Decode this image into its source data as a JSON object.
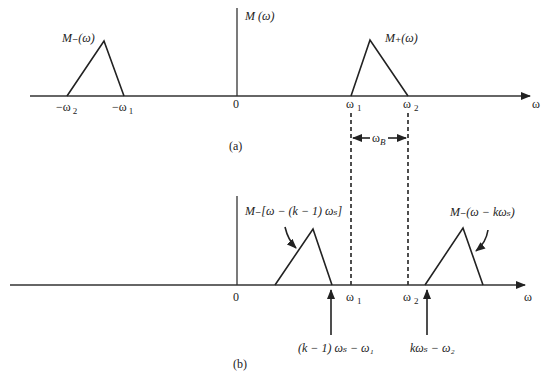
{
  "panel_a": {
    "caption": "(a)",
    "y_axis_label": "M (ω)",
    "x_axis_label": "ω",
    "origin_label": "0",
    "left_spectrum_label": "M₋(ω)",
    "right_spectrum_label": "M₊(ω)",
    "ticks": {
      "neg_w2": "−ω",
      "neg_w2_sub": "2",
      "neg_w1": "−ω",
      "neg_w1_sub": "1",
      "w1": "ω",
      "w1_sub": "1",
      "w2": "ω",
      "w2_sub": "2"
    },
    "bandwidth_label": "ω",
    "bandwidth_sub": "B"
  },
  "panel_b": {
    "caption": "(b)",
    "x_axis_label": "ω",
    "origin_label": "0",
    "shifted_left_label": "M₋[ω − (k − 1) ωₛ]",
    "shifted_right_label": "M₋(ω − kωₛ)",
    "ticks": {
      "w1": "ω",
      "w1_sub": "1",
      "w2": "ω",
      "w2_sub": "2"
    },
    "arrow_left_label": "(k − 1) ωₛ − ω₁",
    "arrow_right_label": "kωₛ − ω₂"
  }
}
